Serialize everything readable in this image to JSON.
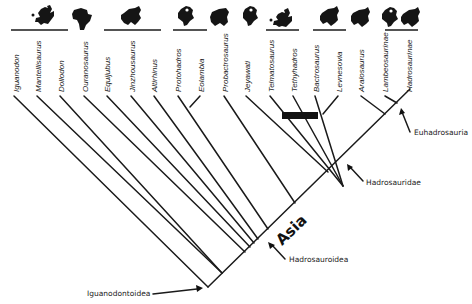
{
  "diagram": {
    "type": "cladogram",
    "taxa": [
      {
        "name": "Iguanodon",
        "continent": "Europe"
      },
      {
        "name": "Mantellisaurus",
        "continent": "Europe"
      },
      {
        "name": "Dollodon",
        "continent": "Europe"
      },
      {
        "name": "Ouranosaurus",
        "continent": "Africa"
      },
      {
        "name": "Equijubus",
        "continent": "Asia"
      },
      {
        "name": "Jinzhousaurus",
        "continent": "Asia"
      },
      {
        "name": "Altirhinus",
        "continent": "Asia"
      },
      {
        "name": "Protohadros",
        "continent": "North America"
      },
      {
        "name": "Eolambia",
        "continent": "North America"
      },
      {
        "name": "Probactrosaurus",
        "continent": "Asia"
      },
      {
        "name": "Jeyawati",
        "continent": "North America"
      },
      {
        "name": "Telmatosaurus",
        "continent": "Europe"
      },
      {
        "name": "Tethyhadros",
        "continent": "Europe"
      },
      {
        "name": "Bactrosaurus",
        "continent": "Asia"
      },
      {
        "name": "Levnesovia",
        "continent": "Asia"
      },
      {
        "name": "Aralosaurus",
        "continent": "Asia"
      },
      {
        "name": "Lambeosaurinae",
        "continent": "North America + Asia"
      },
      {
        "name": "Hadrosaurinae",
        "continent": "North America + Asia"
      }
    ],
    "clade_labels": {
      "iguanodontoidea": "Iguanodontoidea",
      "hadrosauroidea": "Hadrosauroidea",
      "hadrosauridae": "Hadrosauridae",
      "euhadrosauria": "Euhadrosauria"
    },
    "region_label": "Asia",
    "icons": [
      {
        "id": "europe-1",
        "continent": "Europe"
      },
      {
        "id": "africa-1",
        "continent": "Africa"
      },
      {
        "id": "asia-1",
        "continent": "Asia"
      },
      {
        "id": "namerica-1",
        "continent": "North America"
      },
      {
        "id": "asia-2",
        "continent": "Asia"
      },
      {
        "id": "namerica-2",
        "continent": "North America"
      },
      {
        "id": "europe-2",
        "continent": "Europe"
      },
      {
        "id": "asia-3",
        "continent": "Asia"
      },
      {
        "id": "asia-4",
        "continent": "Asia"
      },
      {
        "id": "namerica-3",
        "continent": "North America"
      },
      {
        "id": "asia-5",
        "continent": "Asia"
      }
    ]
  }
}
